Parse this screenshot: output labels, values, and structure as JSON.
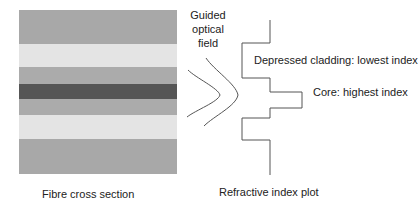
{
  "fibre_cross_section": {
    "caption": "Fibre cross section",
    "bands": [
      {
        "name": "outer-cladding-top",
        "top": 0,
        "height": 34,
        "color": "#a8a8a8"
      },
      {
        "name": "depressed-cladding-top",
        "top": 34,
        "height": 23,
        "color": "#e4e4e4"
      },
      {
        "name": "inner-cladding-top",
        "top": 57,
        "height": 17,
        "color": "#ababab"
      },
      {
        "name": "core",
        "top": 74,
        "height": 15,
        "color": "#555555"
      },
      {
        "name": "inner-cladding-bottom",
        "top": 89,
        "height": 16,
        "color": "#ababab"
      },
      {
        "name": "depressed-cladding-bottom",
        "top": 105,
        "height": 24,
        "color": "#e4e4e4"
      },
      {
        "name": "outer-cladding-bottom",
        "top": 129,
        "height": 35,
        "color": "#a8a8a8"
      }
    ]
  },
  "field": {
    "label_line1": "Guided",
    "label_line2": "optical",
    "label_line3": "field"
  },
  "index_plot": {
    "caption": "Refractive index plot",
    "depressed_label": "Depressed cladding: lowest index",
    "core_label": "Core: highest index"
  }
}
